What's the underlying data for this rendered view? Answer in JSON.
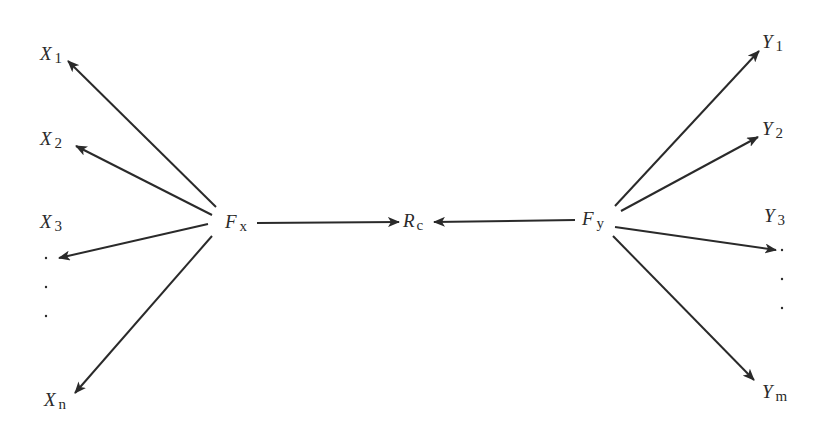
{
  "diagram": {
    "type": "factor-model-path-diagram",
    "nodes": {
      "x1": {
        "base": "X",
        "sub": "1"
      },
      "x2": {
        "base": "X",
        "sub": "2"
      },
      "x3": {
        "base": "X",
        "sub": "3"
      },
      "xn": {
        "base": "X",
        "sub": "n"
      },
      "fx": {
        "base": "F",
        "sub": "x"
      },
      "rc": {
        "base": "R",
        "sub": "c"
      },
      "fy": {
        "base": "F",
        "sub": "y"
      },
      "y1": {
        "base": "Y",
        "sub": "1"
      },
      "y2": {
        "base": "Y",
        "sub": "2"
      },
      "y3": {
        "base": "Y",
        "sub": "3"
      },
      "ym": {
        "base": "Y",
        "sub": "m"
      }
    },
    "edges": [
      {
        "from": "Fx",
        "to": "X1"
      },
      {
        "from": "Fx",
        "to": "X2"
      },
      {
        "from": "Fx",
        "to": "X3"
      },
      {
        "from": "Fx",
        "to": "Xn"
      },
      {
        "from": "Fx",
        "to": "Rc"
      },
      {
        "from": "Fy",
        "to": "Rc"
      },
      {
        "from": "Fy",
        "to": "Y1"
      },
      {
        "from": "Fy",
        "to": "Y2"
      },
      {
        "from": "Fy",
        "to": "Y3"
      },
      {
        "from": "Fy",
        "to": "Ym"
      }
    ],
    "ellipsis_left": "⋮",
    "ellipsis_right": "⋮"
  },
  "colors": {
    "ink": "#2a2a2a",
    "background": "#ffffff"
  }
}
